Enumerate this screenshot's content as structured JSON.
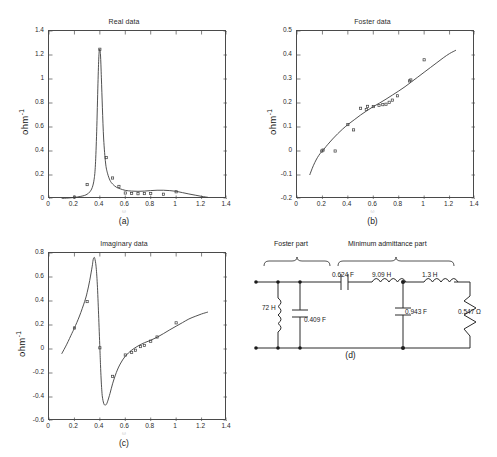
{
  "figure": {
    "panels": [
      "a",
      "b",
      "c",
      "d"
    ],
    "captions": {
      "a": "(a)",
      "b": "(b)",
      "c": "(c)",
      "d": "(d)"
    },
    "ylabel": "ohm",
    "ylabel_exponent": "-1",
    "xlabel_faint": "ω"
  },
  "chart_data": [
    {
      "id": "real-data",
      "type": "line",
      "title": "Real data",
      "xlabel": "ω",
      "ylabel": "ohm^-1",
      "xlim": [
        0,
        1.4
      ],
      "ylim": [
        0,
        1.4
      ],
      "xticks": [
        0,
        0.2,
        0.4,
        0.6,
        0.8,
        1,
        1.2,
        1.4
      ],
      "xticklabels": [
        "0",
        "0.2",
        "0.4",
        "0.6",
        "0.8",
        "1",
        "1.2",
        "1.4"
      ],
      "yticks": [
        0,
        0.2,
        0.4,
        0.6,
        0.8,
        1,
        1.2,
        1.4
      ],
      "yticklabels": [
        "0",
        "0.2",
        "0.4",
        "0.6",
        "0.8",
        "1",
        "1.2",
        "1.4"
      ],
      "grid": false,
      "legend": "none",
      "series": [
        {
          "name": "fitted curve",
          "style": "solid-line",
          "x": [
            0.1,
            0.15,
            0.2,
            0.25,
            0.28,
            0.3,
            0.32,
            0.34,
            0.355,
            0.365,
            0.375,
            0.385,
            0.392,
            0.398,
            0.405,
            0.412,
            0.42,
            0.43,
            0.445,
            0.46,
            0.48,
            0.5,
            0.53,
            0.56,
            0.6,
            0.65,
            0.7,
            0.75,
            0.8,
            0.85,
            0.9,
            0.95,
            1.0,
            1.05,
            1.1,
            1.15,
            1.2,
            1.25
          ],
          "y": [
            0.005,
            0.008,
            0.013,
            0.022,
            0.03,
            0.04,
            0.058,
            0.095,
            0.165,
            0.285,
            0.56,
            0.96,
            1.185,
            1.25,
            1.2,
            1.01,
            0.76,
            0.5,
            0.3,
            0.215,
            0.155,
            0.125,
            0.098,
            0.085,
            0.072,
            0.066,
            0.064,
            0.066,
            0.07,
            0.073,
            0.073,
            0.07,
            0.064,
            0.053,
            0.042,
            0.032,
            0.022,
            0.014
          ]
        },
        {
          "name": "measured points",
          "style": "markers",
          "x": [
            0.2,
            0.3,
            0.4,
            0.45,
            0.5,
            0.55,
            0.6,
            0.65,
            0.7,
            0.75,
            0.8,
            0.9,
            1.0
          ],
          "y": [
            0.016,
            0.12,
            1.248,
            0.345,
            0.175,
            0.105,
            0.05,
            0.046,
            0.044,
            0.045,
            0.046,
            0.04,
            0.06
          ]
        }
      ]
    },
    {
      "id": "foster-data",
      "type": "line",
      "title": "Foster data",
      "xlabel": "ω",
      "ylabel": "ohm^-1",
      "xlim": [
        0,
        1.4
      ],
      "ylim": [
        -0.2,
        0.5
      ],
      "xticks": [
        0,
        0.2,
        0.4,
        0.6,
        0.8,
        1,
        1.2,
        1.4
      ],
      "xticklabels": [
        "0",
        "0.2",
        "0.4",
        "0.6",
        "0.8",
        "1",
        "1.2",
        "1.4"
      ],
      "yticks": [
        -0.2,
        -0.1,
        0,
        0.1,
        0.2,
        0.3,
        0.4,
        0.5
      ],
      "yticklabels": [
        "-0.2",
        "-0.1",
        "0",
        "0.1",
        "0.2",
        "0.3",
        "0.4",
        "0.5"
      ],
      "grid": false,
      "legend": "none",
      "series": [
        {
          "name": "fitted curve",
          "style": "solid-line",
          "x": [
            0.1,
            0.12,
            0.14,
            0.16,
            0.18,
            0.2,
            0.24,
            0.28,
            0.32,
            0.36,
            0.4,
            0.45,
            0.5,
            0.55,
            0.6,
            0.65,
            0.7,
            0.75,
            0.8,
            0.85,
            0.9,
            0.95,
            1.0,
            1.05,
            1.1,
            1.15,
            1.2,
            1.25
          ],
          "y": [
            -0.1,
            -0.072,
            -0.048,
            -0.028,
            -0.012,
            0.0,
            0.026,
            0.05,
            0.072,
            0.092,
            0.11,
            0.13,
            0.15,
            0.168,
            0.185,
            0.2,
            0.216,
            0.233,
            0.25,
            0.268,
            0.288,
            0.308,
            0.328,
            0.348,
            0.368,
            0.388,
            0.406,
            0.42
          ]
        },
        {
          "name": "measured points",
          "style": "markers",
          "x": [
            0.195,
            0.205,
            0.3,
            0.4,
            0.445,
            0.5,
            0.545,
            0.555,
            0.6,
            0.645,
            0.675,
            0.7,
            0.725,
            0.75,
            0.79,
            0.885,
            0.895,
            1.0
          ],
          "y": [
            0.0,
            0.004,
            0.0,
            0.11,
            0.088,
            0.178,
            0.173,
            0.186,
            0.185,
            0.19,
            0.193,
            0.195,
            0.203,
            0.212,
            0.23,
            0.292,
            0.296,
            0.38
          ]
        }
      ]
    },
    {
      "id": "imaginary-data",
      "type": "line",
      "title": "Imaginary data",
      "xlabel": "ω",
      "ylabel": "ohm^-1",
      "xlim": [
        0,
        1.4
      ],
      "ylim": [
        -0.6,
        0.8
      ],
      "xticks": [
        0,
        0.2,
        0.4,
        0.6,
        0.8,
        1,
        1.2,
        1.4
      ],
      "xticklabels": [
        "0",
        "0.2",
        "0.4",
        "0.6",
        "0.8",
        "1",
        "1.2",
        "1.4"
      ],
      "yticks": [
        -0.6,
        -0.4,
        -0.2,
        0,
        0.2,
        0.4,
        0.6,
        0.8
      ],
      "yticklabels": [
        "-0.6",
        "-0.4",
        "-0.2",
        "0",
        "0.2",
        "0.4",
        "0.6",
        "0.8"
      ],
      "grid": false,
      "legend": "none",
      "series": [
        {
          "name": "fitted curve",
          "style": "solid-line",
          "x": [
            0.1,
            0.14,
            0.18,
            0.2,
            0.24,
            0.28,
            0.3,
            0.32,
            0.34,
            0.345,
            0.35,
            0.355,
            0.36,
            0.37,
            0.38,
            0.39,
            0.4,
            0.405,
            0.41,
            0.415,
            0.42,
            0.43,
            0.44,
            0.45,
            0.46,
            0.48,
            0.5,
            0.53,
            0.56,
            0.6,
            0.65,
            0.7,
            0.75,
            0.8,
            0.85,
            0.9,
            0.95,
            1.0,
            1.05,
            1.1,
            1.15,
            1.2,
            1.25
          ],
          "y": [
            -0.04,
            0.04,
            0.13,
            0.175,
            0.275,
            0.395,
            0.47,
            0.57,
            0.69,
            0.73,
            0.755,
            0.762,
            0.755,
            0.69,
            0.54,
            0.29,
            0.01,
            -0.13,
            -0.25,
            -0.34,
            -0.4,
            -0.452,
            -0.468,
            -0.462,
            -0.44,
            -0.37,
            -0.29,
            -0.195,
            -0.125,
            -0.06,
            -0.01,
            0.025,
            0.052,
            0.073,
            0.098,
            0.128,
            0.16,
            0.19,
            0.22,
            0.25,
            0.272,
            0.292,
            0.308
          ]
        },
        {
          "name": "measured points",
          "style": "markers",
          "x": [
            0.2,
            0.3,
            0.4,
            0.5,
            0.6,
            0.65,
            0.68,
            0.72,
            0.75,
            0.8,
            0.85,
            1.0
          ],
          "y": [
            0.175,
            0.395,
            0.01,
            -0.228,
            -0.05,
            -0.028,
            -0.01,
            0.02,
            0.03,
            0.065,
            0.1,
            0.218
          ]
        }
      ]
    }
  ],
  "circuit": {
    "caption": "(d)",
    "groups": [
      {
        "id": "foster-part",
        "label": "Foster part"
      },
      {
        "id": "minimum-admittance-part",
        "label": "Minimum admittance part"
      }
    ],
    "components": [
      {
        "id": "inductor-72h",
        "label": "72 H",
        "kind": "inductor"
      },
      {
        "id": "capacitor-0409f",
        "label": "0.409 F",
        "kind": "capacitor"
      },
      {
        "id": "capacitor-0624f",
        "label": "0.624 F",
        "kind": "capacitor"
      },
      {
        "id": "inductor-909h",
        "label": "9.09 H",
        "kind": "inductor"
      },
      {
        "id": "inductor-13h",
        "label": "1.3 H",
        "kind": "inductor"
      },
      {
        "id": "capacitor-0943f",
        "label": "0.943 F",
        "kind": "capacitor"
      },
      {
        "id": "resistor-0547ohm",
        "label": "0.547 Ω",
        "kind": "resistor"
      }
    ]
  }
}
